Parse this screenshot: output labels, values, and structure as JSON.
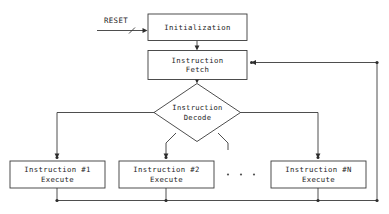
{
  "diagram": {
    "type": "flowchart",
    "background_color": "#ffffff",
    "line_color": "#3a3a3a",
    "text_color": "#1d1d1d",
    "signals": [
      {
        "id": "reset",
        "label": "RESET"
      }
    ],
    "nodes": [
      {
        "id": "initialization",
        "shape": "rectangle",
        "line1": "Initialization",
        "line2": ""
      },
      {
        "id": "instruction-fetch",
        "shape": "rectangle",
        "line1": "Instruction",
        "line2": "Fetch"
      },
      {
        "id": "instruction-decode",
        "shape": "diamond",
        "line1": "Instruction",
        "line2": "Decode"
      },
      {
        "id": "instruction-1-execute",
        "shape": "rectangle",
        "line1": "Instruction  #1",
        "line2": "Execute"
      },
      {
        "id": "instruction-2-execute",
        "shape": "rectangle",
        "line1": "Instruction  #2",
        "line2": "Execute"
      },
      {
        "id": "instruction-n-execute",
        "shape": "rectangle",
        "line1": "Instruction  #N",
        "line2": "Execute"
      }
    ],
    "ellipsis": {
      "id": "branch-ellipsis",
      "label": ". . .",
      "dot_count": 3
    },
    "edges": [
      {
        "id": "reset-to-initialization",
        "from": "reset",
        "to": "initialization",
        "arrow": true
      },
      {
        "id": "initialization-to-fetch",
        "from": "initialization",
        "to": "instruction-fetch",
        "arrow": true
      },
      {
        "id": "fetch-to-decode",
        "from": "instruction-fetch",
        "to": "instruction-decode",
        "arrow": true
      },
      {
        "id": "decode-to-instruction-1",
        "from": "instruction-decode",
        "to": "instruction-1-execute",
        "arrow": true
      },
      {
        "id": "decode-to-instruction-2",
        "from": "instruction-decode",
        "to": "instruction-2-execute",
        "arrow": true
      },
      {
        "id": "decode-to-instruction-n",
        "from": "instruction-decode",
        "to": "instruction-n-execute",
        "arrow": true
      },
      {
        "id": "decode-stub-unused",
        "from": "instruction-decode",
        "to": "",
        "arrow": false
      },
      {
        "id": "instruction-1-to-bus",
        "from": "instruction-1-execute",
        "to": "feedback-bus",
        "arrow": false
      },
      {
        "id": "instruction-2-to-bus",
        "from": "instruction-2-execute",
        "to": "feedback-bus",
        "arrow": false
      },
      {
        "id": "instruction-n-to-bus",
        "from": "instruction-n-execute",
        "to": "feedback-bus",
        "arrow": false
      },
      {
        "id": "feedback-bus-to-fetch",
        "from": "feedback-bus",
        "to": "instruction-fetch",
        "arrow": true
      }
    ]
  }
}
